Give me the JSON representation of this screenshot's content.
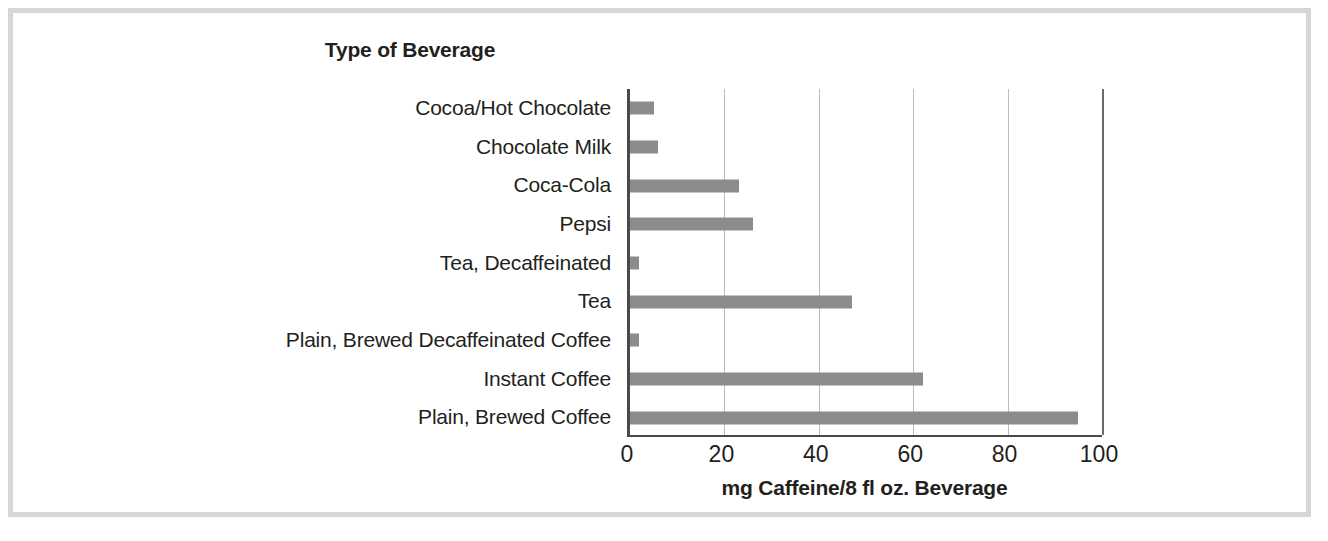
{
  "figure": {
    "background_color": "#ffffff",
    "frame_color": "#d6d6d6"
  },
  "chart_data": {
    "type": "bar",
    "orientation": "horizontal",
    "title": "Type of Beverage",
    "xlabel": "mg Caffeine/8 fl oz. Beverage",
    "ylabel": "",
    "categories": [
      "Cocoa/Hot Chocolate",
      "Chocolate Milk",
      "Coca-Cola",
      "Pepsi",
      "Tea, Decaffeinated",
      "Tea",
      "Plain, Brewed Decaffeinated Coffee",
      "Instant Coffee",
      "Plain, Brewed Coffee"
    ],
    "values": [
      5,
      6,
      23,
      26,
      2,
      47,
      2,
      62,
      95
    ],
    "xlim": [
      0,
      100
    ],
    "xticks": [
      0,
      20,
      40,
      60,
      80,
      100
    ],
    "xtick_labels": [
      "0",
      "20",
      "40",
      "60",
      "80",
      "100"
    ],
    "grid": "vertical",
    "legend": "none",
    "bar_color": "#8c8c8c",
    "axis_color": "#4a4a4a",
    "gridline_color": "#bcbcbc"
  }
}
